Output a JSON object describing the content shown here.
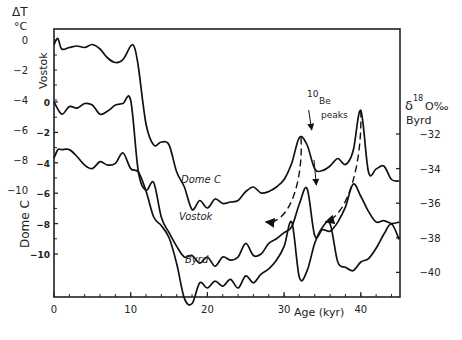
{
  "chart_data": {
    "type": "line",
    "title": "",
    "xlabel": "Age (kyr)",
    "xlim": [
      0,
      45
    ],
    "x_ticks": [
      0,
      10,
      20,
      30,
      40
    ],
    "left_axis_outer": {
      "label_line1": "ΔT",
      "label_line2": "°C",
      "name": "Vostok",
      "ticks": [
        0,
        -2,
        -4,
        -6,
        -8,
        -10
      ],
      "tick_labels": [
        "0",
        "-2",
        "-4",
        "-6",
        "-8",
        "-10"
      ]
    },
    "left_axis_inner": {
      "name": "Dome C",
      "ticks": [
        0,
        -2,
        -4,
        -6,
        -8,
        -10
      ],
      "tick_labels": [
        "0",
        "-2",
        "-4",
        "-6",
        "-8",
        "-10"
      ]
    },
    "right_axis": {
      "label_line1": "δ",
      "label_sup": "18",
      "label_line1b": "O‰",
      "label_line2": "Byrd",
      "ticks": [
        -32,
        -34,
        -36,
        -38,
        -40
      ],
      "tick_labels": [
        "-32",
        "-34",
        "-36",
        "-38",
        "-40"
      ]
    },
    "annotations": {
      "be_sup": "10",
      "be_main": "Be",
      "be_peaks": "peaks"
    },
    "series": [
      {
        "name": "Dome C",
        "axis": "ΔT outer (°C)",
        "label": "Dome C",
        "x": [
          0,
          0.5,
          1,
          2,
          3,
          4,
          5,
          6,
          7,
          8,
          9,
          10,
          10.5,
          11,
          12,
          13,
          14,
          15,
          16,
          17,
          18,
          19,
          20,
          21,
          22,
          23,
          24,
          25,
          26,
          27,
          28,
          29,
          30,
          31,
          32,
          33,
          34,
          35,
          36,
          37,
          38,
          39,
          40,
          41,
          42,
          43,
          44,
          45
        ],
        "values": [
          -0.3,
          0.1,
          -0.6,
          -0.5,
          -0.4,
          -0.5,
          -0.3,
          -0.6,
          -1.2,
          -1.5,
          -1.3,
          -0.4,
          -0.5,
          -1.8,
          -5.6,
          -7.0,
          -6.8,
          -7.0,
          -8.8,
          -9.8,
          -11.3,
          -10.7,
          -11.2,
          -10.6,
          -10.9,
          -10.8,
          -10.7,
          -10.1,
          -9.8,
          -10.2,
          -10.1,
          -9.8,
          -9.3,
          -8.2,
          -6.5,
          -7.0,
          -8.6,
          -8.7,
          -8.4,
          -7.9,
          -8.3,
          -7.4,
          -4.7,
          -8.8,
          -8.6,
          -8.4,
          -9.3,
          -9.4
        ]
      },
      {
        "name": "Vostok",
        "axis": "Dome C inner (°C)",
        "label": "Vostok",
        "x": [
          0,
          1,
          2,
          3,
          4,
          5,
          6,
          7,
          8,
          9,
          10,
          11,
          12,
          13,
          14,
          15,
          16,
          17,
          18,
          19,
          20,
          21,
          22,
          23,
          24,
          25,
          26,
          27,
          28,
          29,
          30,
          31,
          32,
          33,
          34,
          35,
          36,
          37,
          38,
          39,
          40,
          41,
          42,
          43,
          44,
          45
        ],
        "values": [
          0,
          -0.8,
          -0.3,
          -0.4,
          -0.1,
          -0.2,
          -0.8,
          -0.6,
          -0.2,
          -0.1,
          0.1,
          -4.6,
          -5.8,
          -5.3,
          -7.6,
          -8.6,
          -9.5,
          -10.2,
          -10.1,
          -10.6,
          -10.2,
          -10.8,
          -10.2,
          -10.4,
          -10.2,
          -9.3,
          -10.1,
          -10.0,
          -9.3,
          -9.0,
          -8.6,
          -8.2,
          -6.7,
          -5.7,
          -8.8,
          -8.4,
          -8.5,
          -7.9,
          -6.9,
          -5.4,
          -6.2,
          -7.2,
          -7.9,
          -7.8,
          -8.0,
          -7.9
        ]
      },
      {
        "name": "Byrd",
        "axis": "δ18O ‰ (right)",
        "label": "Byrd",
        "x": [
          0,
          0.5,
          1,
          2,
          3,
          4,
          5,
          6,
          7,
          8,
          9,
          10,
          11,
          12,
          13,
          14,
          15,
          16,
          17,
          18,
          19,
          20,
          21,
          22,
          23,
          24,
          25,
          26,
          27,
          28,
          29,
          30,
          31,
          32,
          33,
          34,
          35,
          36,
          37,
          38,
          39,
          40,
          41,
          42,
          43,
          44,
          45
        ],
        "values": [
          -33.4,
          -32.9,
          -32.9,
          -32.9,
          -33.3,
          -33.8,
          -34.0,
          -33.6,
          -33.8,
          -33.7,
          -33.1,
          -34.0,
          -34.2,
          -35.3,
          -36.8,
          -37.3,
          -38.0,
          -39.5,
          -41.5,
          -41.8,
          -40.6,
          -40.9,
          -40.5,
          -40.8,
          -40.4,
          -40.9,
          -40.2,
          -40.6,
          -40.1,
          -39.8,
          -39.3,
          -38.5,
          -37.1,
          -40.3,
          -39.9,
          -38.3,
          -37.4,
          -37.2,
          -39.4,
          -39.7,
          -39.9,
          -39.4,
          -39.2,
          -38.6,
          -37.8,
          -37.2,
          -38.1
        ]
      }
    ],
    "arrows": [
      {
        "type": "dashed",
        "from_series": "Dome C",
        "from_age": 32,
        "to_series": "Byrd",
        "to_age": 27.5
      },
      {
        "type": "dashed",
        "from_series": "Dome C",
        "from_age": 40,
        "to_series": "Byrd",
        "to_age": 35.5
      },
      {
        "type": "solid",
        "note": "10Be peaks pointer",
        "from_age": 33.5,
        "to_series": "Dome C"
      },
      {
        "type": "solid",
        "note": "10Be peaks pointer",
        "from_age": 34,
        "to_series": "Vostok"
      }
    ],
    "grid": false,
    "legend": "none (inline labels)"
  }
}
